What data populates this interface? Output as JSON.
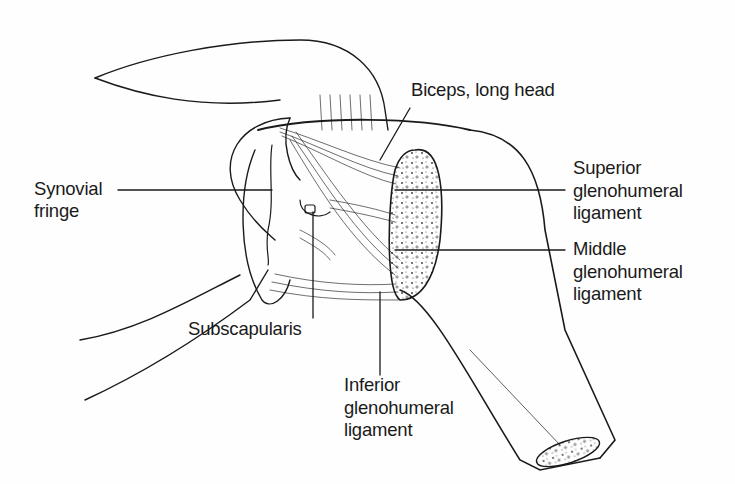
{
  "diagram": {
    "labels": {
      "biceps": "Biceps, long head",
      "synovial_1": "Synovial",
      "synovial_2": "fringe",
      "superior_1": "Superior",
      "superior_2": "glenohumeral",
      "superior_3": "ligament",
      "middle_1": "Middle",
      "middle_2": "glenohumeral",
      "middle_3": "ligament",
      "subscapularis": "Subscapularis",
      "inferior_1": "Inferior",
      "inferior_2": "glenohumeral",
      "inferior_3": "ligament"
    },
    "colors": {
      "ink": "#1a1a1a",
      "background": "#fefefe",
      "shade": "#b8b8b8"
    }
  }
}
